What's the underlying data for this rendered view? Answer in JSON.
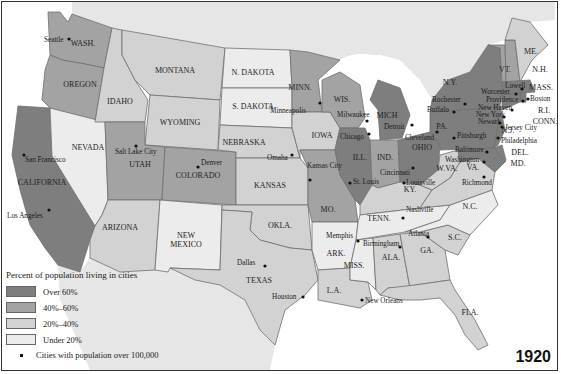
{
  "map": {
    "year": "1920",
    "colors": {
      "over60": "#7e7e7e",
      "40to60": "#a3a3a3",
      "20to40": "#d2d2d2",
      "under20": "#ececec",
      "land_foreign": "#e6e6e6",
      "water": "#ffffff"
    },
    "legend": {
      "title": "Percent of population living in cities",
      "items": [
        {
          "key": "over60",
          "label": "Over 60%"
        },
        {
          "key": "40to60",
          "label": "40%–60%"
        },
        {
          "key": "20to40",
          "label": "20%–40%"
        },
        {
          "key": "under20",
          "label": "Under 20%"
        }
      ],
      "cities_label": "Cities with population over 100,000"
    },
    "states": [
      {
        "name": "WASH.",
        "cat": "40to60",
        "lx": 83,
        "ly": 46,
        "pts": "48,12 60,12 68,22 72,14 112,28 104,68 85,64 62,60 50,55"
      },
      {
        "name": "OREGON",
        "cat": "40to60",
        "lx": 80,
        "ly": 87,
        "pts": "50,55 62,60 85,64 104,68 95,122 50,108 42,100 45,70"
      },
      {
        "name": "CALIFORNIA",
        "cat": "over60",
        "lx": 42,
        "ly": 185,
        "pts": "18,106 50,108 52,156 95,226 90,240 80,272 58,265 45,248 30,225 20,190 12,155"
      },
      {
        "name": "NEVADA",
        "cat": "under20",
        "lx": 88,
        "ly": 150,
        "pts": "50,108 105,122 108,200 102,215 95,226 52,156"
      },
      {
        "name": "IDAHO",
        "cat": "20to40",
        "lx": 120,
        "ly": 104,
        "pts": "112,28 122,30 122,55 135,80 148,100 145,122 105,122 95,122 104,68"
      },
      {
        "name": "MONTANA",
        "cat": "20to40",
        "lx": 175,
        "ly": 73,
        "pts": "122,30 225,48 220,100 150,95 145,90 135,80 122,55"
      },
      {
        "name": "WYOMING",
        "cat": "20to40",
        "lx": 180,
        "ly": 125,
        "pts": "150,95 220,100 218,150 145,145"
      },
      {
        "name": "UTAH",
        "cat": "40to60",
        "lx": 140,
        "ly": 167,
        "pts": "105,122 145,122 145,145 165,147 162,200 108,200"
      },
      {
        "name": "COLORADO",
        "cat": "40to60",
        "lx": 198,
        "ly": 178,
        "pts": "165,147 236,152 236,205 162,200"
      },
      {
        "name": "ARIZONA",
        "cat": "20to40",
        "lx": 120,
        "ly": 230,
        "pts": "108,200 160,200 155,270 120,272 90,258 90,240 95,226 102,215"
      },
      {
        "name": "NEW\nMEXICO",
        "cat": "under20",
        "lx": 186,
        "ly": 238,
        "pts": "160,200 222,205 220,270 170,268 168,272 155,270"
      },
      {
        "name": "N. DAKOTA",
        "cat": "under20",
        "lx": 253,
        "ly": 75,
        "pts": "225,48 290,50 292,88 222,88"
      },
      {
        "name": "S. DAKOTA",
        "cat": "under20",
        "lx": 253,
        "ly": 109,
        "pts": "222,88 292,88 292,128 220,125"
      },
      {
        "name": "NEBRASKA",
        "cat": "20to40",
        "lx": 244,
        "ly": 145,
        "pts": "220,125 292,128 300,158 236,158 236,152 218,150"
      },
      {
        "name": "KANSAS",
        "cat": "20to40",
        "lx": 270,
        "ly": 188,
        "pts": "236,158 300,158 308,168 308,205 236,205"
      },
      {
        "name": "OKLA.",
        "cat": "20to40",
        "lx": 280,
        "ly": 228,
        "pts": "222,205 308,205 312,250 290,248 260,240 250,230 252,212 222,210"
      },
      {
        "name": "TEXAS",
        "cat": "20to40",
        "lx": 259,
        "ly": 283,
        "pts": "222,210 252,212 250,230 260,240 290,248 312,250 318,280 305,295 285,310 275,345 260,330 245,300 220,285 195,280 170,268 220,270"
      },
      {
        "name": "MINN.",
        "cat": "40to60",
        "lx": 300,
        "ly": 90,
        "pts": "290,50 308,52 340,60 318,80 322,112 292,112 292,88"
      },
      {
        "name": "IOWA",
        "cat": "20to40",
        "lx": 322,
        "ly": 138,
        "pts": "292,112 330,112 340,128 335,150 300,150 300,158 292,128"
      },
      {
        "name": "MO.",
        "cat": "40to60",
        "lx": 328,
        "ly": 212,
        "pts": "300,150 335,150 340,175 355,200 358,222 312,222 308,205 308,168"
      },
      {
        "name": "ARK.",
        "cat": "under20",
        "lx": 336,
        "ly": 256,
        "pts": "312,222 358,222 356,240 350,268 318,270 312,250"
      },
      {
        "name": "L.A.",
        "cat": "20to40",
        "lx": 334,
        "ly": 293,
        "pts": "318,270 350,268 350,280 368,282 372,300 360,308 318,300"
      },
      {
        "name": "WIS.",
        "cat": "40to60",
        "lx": 342,
        "ly": 102,
        "pts": "322,80 340,72 360,85 365,118 358,128 340,128 330,112 322,112"
      },
      {
        "name": "ILL.",
        "cat": "over60",
        "lx": 360,
        "ly": 160,
        "pts": "340,128 365,128 370,140 372,185 360,205 355,200 340,175 335,150"
      },
      {
        "name": "MICH",
        "cat": "over60",
        "lx": 387,
        "ly": 118,
        "pts": "378,80 400,88 410,115 402,138 380,140 378,110 370,100"
      },
      {
        "name": "IND.",
        "cat": "40to60",
        "lx": 385,
        "ly": 160,
        "pts": "370,140 398,140 400,182 378,188 372,185"
      },
      {
        "name": "OHIO",
        "cat": "over60",
        "lx": 422,
        "ly": 150,
        "pts": "398,140 430,132 440,145 438,170 420,185 400,182"
      },
      {
        "name": "KY.",
        "cat": "20to40",
        "lx": 410,
        "ly": 192,
        "pts": "372,185 378,188 400,182 420,185 432,190 420,208 360,215 360,205"
      },
      {
        "name": "TENN.",
        "cat": "under20",
        "lx": 379,
        "ly": 221,
        "pts": "360,215 420,208 450,205 440,220 405,232 356,240 358,222"
      },
      {
        "name": "MISS.",
        "cat": "under20",
        "lx": 354,
        "ly": 268,
        "pts": "356,240 373,238 376,290 368,282 350,280 350,268"
      },
      {
        "name": "ALA.",
        "cat": "20to40",
        "lx": 391,
        "ly": 260,
        "pts": "373,238 400,234 410,288 388,288 380,295 376,290"
      },
      {
        "name": "GA.",
        "cat": "20to40",
        "lx": 427,
        "ly": 253,
        "pts": "400,234 420,232 445,250 450,280 415,285 410,288"
      },
      {
        "name": "FLA.",
        "cat": "20to40",
        "lx": 470,
        "ly": 315,
        "pts": "380,295 388,288 415,285 450,280 455,290 475,320 488,345 478,350 465,335 455,315 440,298 420,300 400,300"
      },
      {
        "name": "S.C.",
        "cat": "20to40",
        "lx": 455,
        "ly": 240,
        "pts": "420,232 448,225 470,235 458,255 445,250"
      },
      {
        "name": "N.C.",
        "cat": "under20",
        "lx": 470,
        "ly": 209,
        "pts": "405,232 440,220 450,205 492,190 498,205 470,235 448,225 420,232"
      },
      {
        "name": "VA.",
        "cat": "20to40",
        "lx": 473,
        "ly": 170,
        "pts": "432,190 450,178 460,162 478,158 495,172 492,190 450,205 420,208"
      },
      {
        "name": "W.VA.",
        "cat": "20to40",
        "lx": 447,
        "ly": 171,
        "pts": "438,170 440,155 458,150 460,162 450,178 432,190 420,185"
      },
      {
        "name": "PA.",
        "cat": "over60",
        "lx": 442,
        "ly": 129,
        "pts": "430,112 490,108 498,125 494,148 440,150 440,145 430,132"
      },
      {
        "name": "MD.",
        "cat": "over60",
        "lx": 518,
        "ly": 166,
        "pts": "458,150 494,148 505,162 495,172 478,158 460,162"
      },
      {
        "name": "DEL.",
        "cat": "over60",
        "lx": 520,
        "ly": 155,
        "pts": "494,148 502,145 506,160 505,162"
      },
      {
        "name": "N.J.",
        "cat": "over60",
        "lx": 508,
        "ly": 133,
        "pts": "490,108 500,105 505,130 498,145 494,148 498,125"
      },
      {
        "name": "N.Y.",
        "cat": "over60",
        "lx": 450,
        "ly": 85,
        "pts": "432,100 448,80 470,72 488,45 500,48 502,95 500,105 490,108 430,112"
      },
      {
        "name": "VT.",
        "cat": "40to60",
        "lx": 505,
        "ly": 72,
        "pts": "488,45 505,45 506,82 502,82 500,48"
      },
      {
        "name": "N.H.",
        "cat": "40to60",
        "lx": 540,
        "ly": 72,
        "pts": "505,40 515,40 520,82 506,82"
      },
      {
        "name": "ME.",
        "cat": "20to40",
        "lx": 531,
        "ly": 54,
        "pts": "505,40 512,18 530,22 548,45 532,60 520,82 515,40"
      },
      {
        "name": "MASS.",
        "cat": "over60",
        "lx": 541,
        "ly": 90,
        "pts": "502,82 530,80 535,92 520,93 502,95"
      },
      {
        "name": "R.I.",
        "cat": "over60",
        "lx": 544,
        "ly": 113,
        "pts": "520,93 526,93 526,102 520,102"
      },
      {
        "name": "CONN.",
        "cat": "over60",
        "lx": 545,
        "ly": 124,
        "pts": "502,95 520,93 520,102 502,110"
      }
    ],
    "cities": [
      {
        "name": "Seattle",
        "x": 69,
        "y": 39,
        "tx": 44,
        "ty": 42
      },
      {
        "name": "San Francisco",
        "x": 24,
        "y": 155,
        "tx": 25,
        "ty": 162
      },
      {
        "name": "Los Angeles",
        "x": 49,
        "y": 210,
        "tx": 7,
        "ty": 218
      },
      {
        "name": "Salt Lake City",
        "x": 136,
        "y": 146,
        "tx": 115,
        "ty": 154
      },
      {
        "name": "Denver",
        "x": 198,
        "y": 167,
        "tx": 201,
        "ty": 165
      },
      {
        "name": "Minneapolis",
        "x": 320,
        "y": 103,
        "tx": 270,
        "ty": 113
      },
      {
        "name": "Omaha",
        "x": 292,
        "y": 155,
        "tx": 267,
        "ty": 160
      },
      {
        "name": "Kansas City",
        "x": 310,
        "y": 180,
        "tx": 307,
        "ty": 168
      },
      {
        "name": "Milwaukee",
        "x": 367,
        "y": 121,
        "tx": 337,
        "ty": 117
      },
      {
        "name": "Chicago",
        "x": 369,
        "y": 134,
        "tx": 340,
        "ty": 139
      },
      {
        "name": "St. Louis",
        "x": 350,
        "y": 183,
        "tx": 353,
        "ty": 184
      },
      {
        "name": "Detroit",
        "x": 412,
        "y": 125,
        "tx": 384,
        "ty": 129
      },
      {
        "name": "Cleveland",
        "x": 437,
        "y": 132,
        "tx": 405,
        "ty": 140
      },
      {
        "name": "Cincinnati",
        "x": 413,
        "y": 168,
        "tx": 380,
        "ty": 175
      },
      {
        "name": "Louisville",
        "x": 404,
        "y": 183,
        "tx": 406,
        "ty": 185
      },
      {
        "name": "Nashville",
        "x": 403,
        "y": 218,
        "tx": 406,
        "ty": 212
      },
      {
        "name": "Memphis",
        "x": 358,
        "y": 241,
        "tx": 326,
        "ty": 238
      },
      {
        "name": "Birmingham",
        "x": 400,
        "y": 247,
        "tx": 363,
        "ty": 246
      },
      {
        "name": "Atlanta",
        "x": 428,
        "y": 237,
        "tx": 408,
        "ty": 236
      },
      {
        "name": "Dallas",
        "x": 265,
        "y": 266,
        "tx": 237,
        "ty": 265
      },
      {
        "name": "Houston",
        "x": 303,
        "y": 297,
        "tx": 272,
        "ty": 299
      },
      {
        "name": "New Orleans",
        "x": 362,
        "y": 300,
        "tx": 365,
        "ty": 303
      },
      {
        "name": "Rochester",
        "x": 465,
        "y": 104,
        "tx": 432,
        "ty": 102
      },
      {
        "name": "Buffalo",
        "x": 454,
        "y": 112,
        "tx": 427,
        "ty": 112
      },
      {
        "name": "Pittsburgh",
        "x": 454,
        "y": 138,
        "tx": 457,
        "ty": 138
      },
      {
        "name": "Washington",
        "x": 484,
        "y": 162,
        "tx": 445,
        "ty": 162
      },
      {
        "name": "Baltimore",
        "x": 487,
        "y": 152,
        "tx": 455,
        "ty": 152
      },
      {
        "name": "Richmond",
        "x": 484,
        "y": 177,
        "tx": 462,
        "ty": 185
      },
      {
        "name": "Philadelphia",
        "x": 498,
        "y": 138,
        "tx": 501,
        "ty": 143
      },
      {
        "name": "Jersey City",
        "x": 502,
        "y": 127,
        "tx": 505,
        "ty": 130
      },
      {
        "name": "Newark",
        "x": 500,
        "y": 123,
        "tx": 478,
        "ty": 124
      },
      {
        "name": "New York",
        "x": 504,
        "y": 117,
        "tx": 476,
        "ty": 117
      },
      {
        "name": "New Haven",
        "x": 512,
        "y": 110,
        "tx": 478,
        "ty": 110
      },
      {
        "name": "Providence",
        "x": 523,
        "y": 101,
        "tx": 486,
        "ty": 102
      },
      {
        "name": "Worcester",
        "x": 516,
        "y": 94,
        "tx": 481,
        "ty": 94
      },
      {
        "name": "Boston",
        "x": 528,
        "y": 99,
        "tx": 530,
        "ty": 101
      },
      {
        "name": "Lowell",
        "x": 522,
        "y": 89,
        "tx": 505,
        "ty": 88
      }
    ]
  }
}
